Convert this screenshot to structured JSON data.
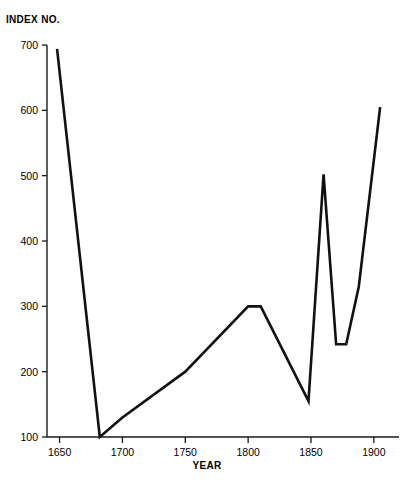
{
  "chart_data": {
    "type": "line",
    "title": "",
    "ylabel": "INDEX NO.",
    "xlabel": "YEAR",
    "xlim": [
      1640,
      1920
    ],
    "ylim": [
      100,
      715
    ],
    "grid": false,
    "legend": null,
    "x_ticks": [
      1650,
      1700,
      1750,
      1800,
      1850,
      1900
    ],
    "y_ticks": [
      100,
      200,
      300,
      400,
      500,
      600,
      700
    ],
    "x_tick_labels": [
      "1650",
      "1700",
      "1750",
      "1800",
      "1850",
      "1900"
    ],
    "y_tick_labels": [
      "100",
      "200",
      "300",
      "400",
      "500",
      "600",
      "700"
    ],
    "series": [
      {
        "name": "Index",
        "x": [
          1648,
          1682,
          1700,
          1750,
          1800,
          1810,
          1848,
          1860,
          1870,
          1878,
          1888,
          1905
        ],
        "values": [
          694,
          100,
          130,
          200,
          300,
          300,
          155,
          502,
          242,
          242,
          330,
          605
        ]
      }
    ]
  },
  "labels": {
    "y_axis_title": "INDEX NO.",
    "x_axis_title": "YEAR"
  }
}
